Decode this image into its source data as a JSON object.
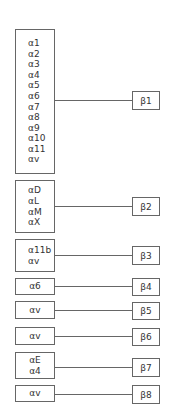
{
  "diagram": {
    "type": "mapping",
    "line_color": "#666666",
    "text_color": "#333333",
    "groups": [
      {
        "alpha_items": [
          "α1",
          "α2",
          "α3",
          "α4",
          "α5",
          "α6",
          "α7",
          "α8",
          "α9",
          "α10",
          "α11",
          "αv"
        ],
        "beta_label": "β1"
      },
      {
        "alpha_items": [
          "αD",
          "αL",
          "αM",
          "αX"
        ],
        "beta_label": "β2"
      },
      {
        "alpha_items": [
          "α11b",
          "αv"
        ],
        "beta_label": "β3"
      },
      {
        "alpha_items": [
          "α6"
        ],
        "beta_label": "β4"
      },
      {
        "alpha_items": [
          "αv"
        ],
        "beta_label": "β5"
      },
      {
        "alpha_items": [
          "αv"
        ],
        "beta_label": "β6"
      },
      {
        "alpha_items": [
          "αE",
          "α4"
        ],
        "beta_label": "β7"
      },
      {
        "alpha_items": [
          "αv"
        ],
        "beta_label": "β8"
      }
    ]
  }
}
